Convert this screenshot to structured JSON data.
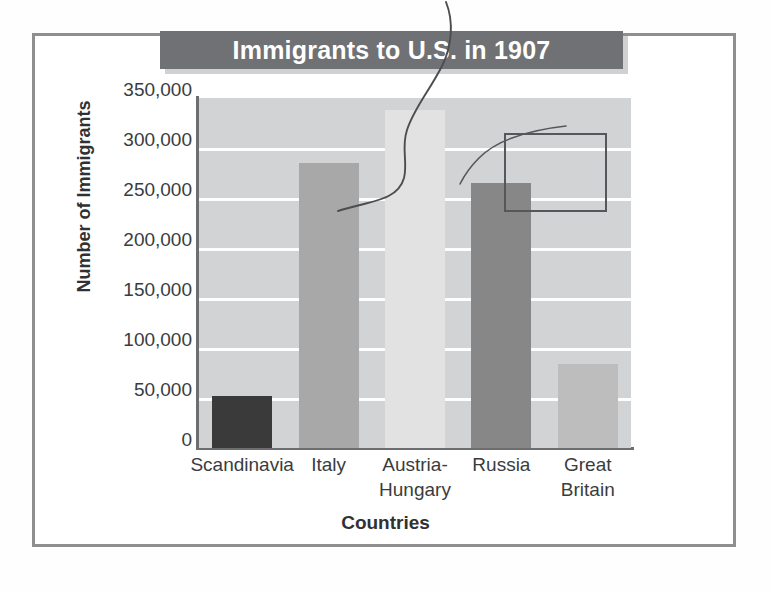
{
  "figure": {
    "title": "Immigrants to U.S. in 1907",
    "xlabel": "Countries",
    "ylabel": "Number of Immigrants"
  },
  "colors": {
    "title_banner_bg": "#6f7174",
    "title_text": "#ffffff",
    "plot_bg": "#d2d3d4",
    "gridline": "#fdfdfd",
    "axis": "#6c6e70",
    "frame": "#8d8f91",
    "annotation": "#55575a",
    "bar_scandinavia": "#3a3a3a",
    "bar_italy": "#a8a8a8",
    "bar_austria_hungary": "#e2e2e2",
    "bar_russia": "#878787",
    "bar_great_britain": "#bdbdbd"
  },
  "axis": {
    "y_tick_labels": [
      "350,000",
      "300,000",
      "250,000",
      "200,000",
      "150,000",
      "100,000",
      "50,000",
      "0"
    ],
    "y_tick_values": [
      350000,
      300000,
      250000,
      200000,
      150000,
      100000,
      50000,
      0
    ]
  },
  "annotations": {
    "highlight_box_target": "Russia",
    "squiggle_note": "hand-drawn pen marks over chart"
  },
  "chart_data": {
    "type": "bar",
    "title": "Immigrants to U.S. in 1907",
    "xlabel": "Countries",
    "ylabel": "Number of Immigrants",
    "categories": [
      "Scandinavia",
      "Italy",
      "Austria-Hungary",
      "Russia",
      "Great Britain"
    ],
    "category_lines": [
      [
        "Scandinavia"
      ],
      [
        "Italy"
      ],
      [
        "Austria-",
        "Hungary"
      ],
      [
        "Russia"
      ],
      [
        "Great Britain"
      ]
    ],
    "values": [
      52000,
      285000,
      338000,
      265000,
      84000
    ],
    "bar_colors": [
      "#3a3a3a",
      "#a8a8a8",
      "#e2e2e2",
      "#878787",
      "#bdbdbd"
    ],
    "ylim": [
      0,
      350000
    ],
    "ytick_step": 50000,
    "grid": true,
    "legend": false
  }
}
